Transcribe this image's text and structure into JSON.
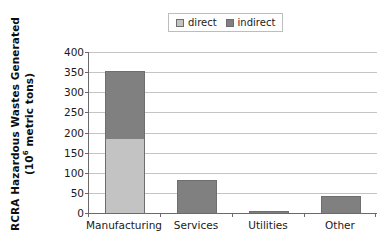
{
  "chart_data": {
    "type": "bar",
    "subtype": "stacked-vertical",
    "title": "",
    "xlabel": "",
    "ylabel": "RCRA Hazardous Wastes Generated (10⁶ metric tons)",
    "ylabel_line1": "RCRA Hazardous Wastes Generated",
    "ylabel_line2_prefix": "(10",
    "ylabel_line2_sup": "6",
    "ylabel_line2_suffix": " metric tons)",
    "categories": [
      "Manufacturing",
      "Services",
      "Utilities",
      "Other"
    ],
    "series": [
      {
        "name": "direct",
        "color": "#c3c3c3",
        "values": [
          185,
          0,
          0,
          0
        ]
      },
      {
        "name": "indirect",
        "color": "#808080",
        "values": [
          167,
          82,
          5,
          42
        ]
      }
    ],
    "totals": [
      352,
      82,
      5,
      42
    ],
    "ylim": [
      0,
      400
    ],
    "ytick_step": 50,
    "ytick_labels": [
      "400",
      "350",
      "300",
      "250",
      "200",
      "150",
      "100",
      "50",
      "0"
    ],
    "ytick_values": [
      400,
      350,
      300,
      250,
      200,
      150,
      100,
      50,
      0
    ],
    "grid": true,
    "grid_axis": "y",
    "legend": {
      "position": "top-center",
      "boxed": true,
      "entries": [
        {
          "label": "direct",
          "swatch": "legend-swatch-direct",
          "color": "#c3c3c3"
        },
        {
          "label": "indirect",
          "swatch": "legend-swatch-indirect",
          "color": "#808080"
        }
      ]
    },
    "colors": {
      "direct": "#c3c3c3",
      "indirect": "#808080",
      "axis": "#6a6a6a",
      "grid": "#c4c4c4",
      "text": "#1a1a1a",
      "background": "#ffffff"
    }
  }
}
